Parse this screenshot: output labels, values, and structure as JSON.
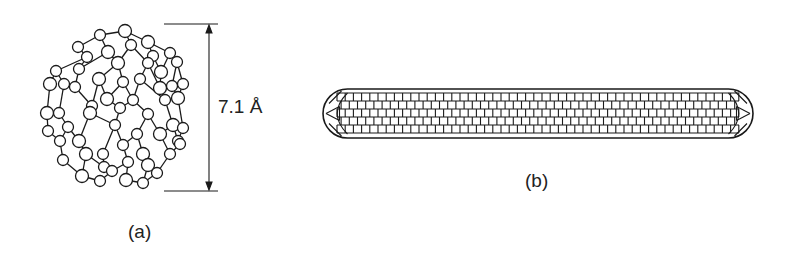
{
  "figure": {
    "panels": [
      {
        "id": "a",
        "label": "(a)",
        "subject": "C60 fullerene molecule (ball-and-stick)",
        "dimension": {
          "value": "7.1 Å",
          "orientation": "vertical"
        }
      },
      {
        "id": "b",
        "label": "(b)",
        "subject": "capped carbon nanotube (hexagonal lattice)"
      }
    ],
    "colors": {
      "ink": "#1a1a1a",
      "background": "#ffffff",
      "atom_fill": "#ffffff"
    }
  }
}
